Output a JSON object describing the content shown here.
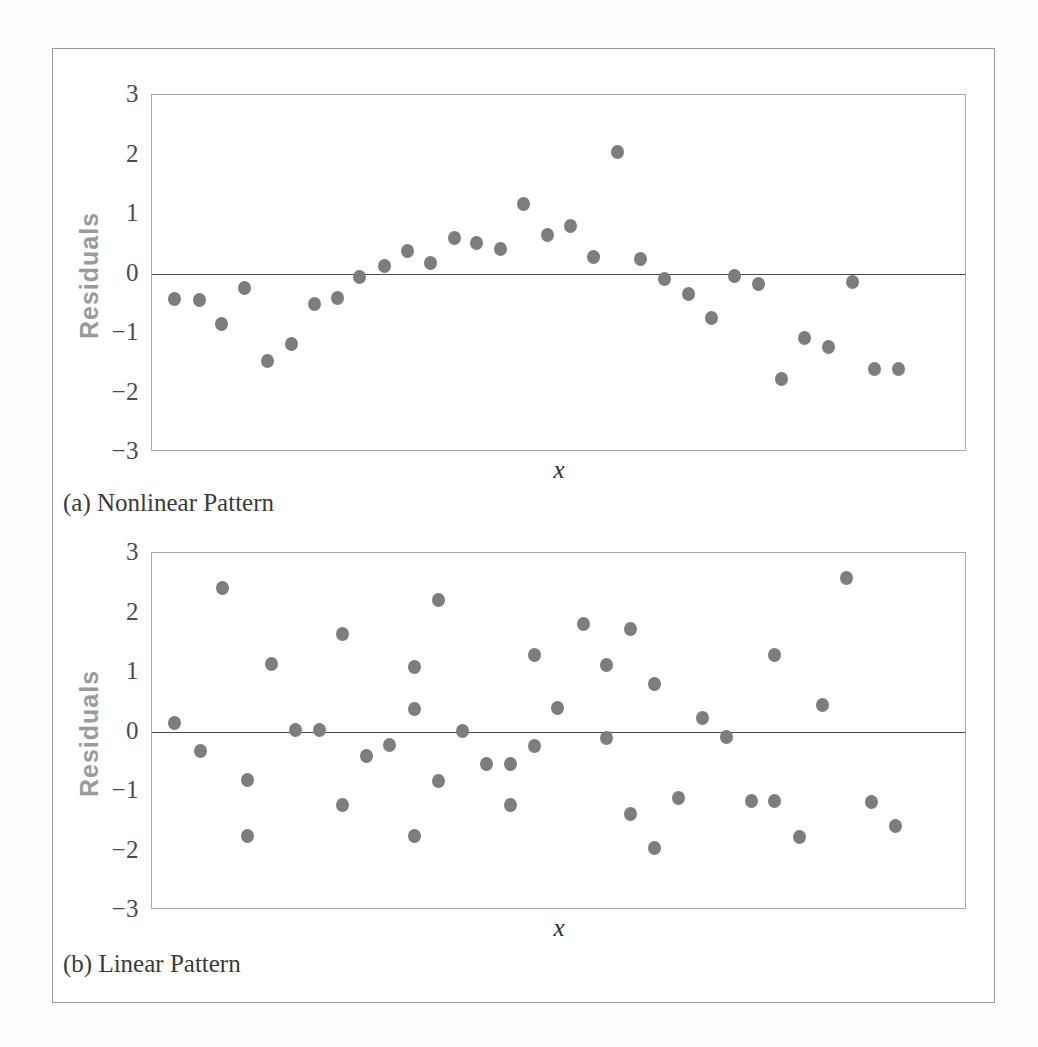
{
  "figure": {
    "panels": [
      {
        "id": "panel-a",
        "caption": "(a) Nonlinear Pattern",
        "ylabel": "Residuals",
        "xlabel": "x",
        "yticks": [
          "3",
          "2",
          "1",
          "0",
          "−1",
          "−2",
          "−3"
        ]
      },
      {
        "id": "panel-b",
        "caption": "(b) Linear Pattern",
        "ylabel": "Residuals",
        "xlabel": "x",
        "yticks": [
          "3",
          "2",
          "1",
          "0",
          "−1",
          "−2",
          "−3"
        ]
      }
    ],
    "colors": {
      "marker": "#7d7d7d",
      "zero_line": "#4a4a4a",
      "axis_frame": "#a8a8a8",
      "figure_frame": "#9a9a9a",
      "ylabel_text": "#9b9b9b",
      "tick_text": "#4c4c4c"
    }
  },
  "chart_data": [
    {
      "type": "scatter",
      "title": "(a) Nonlinear Pattern",
      "xlabel": "x",
      "ylabel": "Residuals",
      "ylim": [
        -3,
        3
      ],
      "xlim": [
        0,
        100
      ],
      "yticks": [
        3,
        2,
        1,
        0,
        -1,
        -2,
        -3
      ],
      "grid": false,
      "legend": "none",
      "reference_line_y": 0,
      "x": [
        2.8,
        5.8,
        8.5,
        11.4,
        14.2,
        17.1,
        19.9,
        22.7,
        25.5,
        28.5,
        31.3,
        34.2,
        37.1,
        39.8,
        42.7,
        45.6,
        48.5,
        51.3,
        54.2,
        57.1,
        59.9,
        62.9,
        65.8,
        68.7,
        71.5,
        74.4,
        77.3,
        80.1,
        83.0,
        85.9,
        88.7,
        91.6
      ],
      "y": [
        -0.43,
        -0.45,
        -0.85,
        -0.25,
        -1.47,
        -1.18,
        -0.52,
        -0.42,
        -0.06,
        0.13,
        0.37,
        0.17,
        0.59,
        0.52,
        0.42,
        1.17,
        0.64,
        0.8,
        0.28,
        2.05,
        0.25,
        -0.09,
        -0.35,
        -0.74,
        -0.04,
        -0.18,
        -1.77,
        -1.08,
        -1.24,
        -0.15,
        -1.6,
        -1.6
      ]
    },
    {
      "type": "scatter",
      "title": "(b) Linear Pattern",
      "xlabel": "x",
      "ylabel": "Residuals",
      "ylim": [
        -3,
        3
      ],
      "xlim": [
        0,
        100
      ],
      "yticks": [
        3,
        2,
        1,
        0,
        -1,
        -2,
        -3
      ],
      "grid": false,
      "legend": "none",
      "reference_line_y": 0,
      "x": [
        2.8,
        5.9,
        8.7,
        11.7,
        11.7,
        14.7,
        17.6,
        20.5,
        23.4,
        23.4,
        26.3,
        29.2,
        32.2,
        32.2,
        32.2,
        35.1,
        35.1,
        38.1,
        41.0,
        44.0,
        44.0,
        46.9,
        46.9,
        49.8,
        52.9,
        55.8,
        55.8,
        58.7,
        58.7,
        61.7,
        61.7,
        64.6,
        67.6,
        70.5,
        73.5,
        76.4,
        76.4,
        79.4,
        82.3,
        85.2,
        88.3,
        91.2
      ],
      "y": [
        0.15,
        -0.33,
        2.42,
        -0.82,
        -1.76,
        1.13,
        0.02,
        0.02,
        1.64,
        -1.23,
        -0.41,
        -0.23,
        1.08,
        0.37,
        -1.76,
        2.21,
        -0.83,
        0.01,
        -0.55,
        -0.54,
        -1.24,
        1.28,
        -0.24,
        0.4,
        1.81,
        1.12,
        -0.11,
        1.73,
        -1.39,
        0.8,
        -1.95,
        -1.11,
        0.22,
        -0.1,
        -1.17,
        1.28,
        -1.16,
        -1.77,
        0.45,
        2.58,
        -1.18,
        -1.58
      ]
    }
  ]
}
